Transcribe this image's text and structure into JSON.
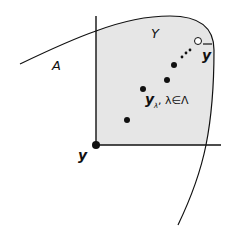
{
  "diagram": {
    "labels": {
      "set_A": "A",
      "set_Y": "Y",
      "point_bar_y": "y",
      "sequence_main": "y",
      "sequence_sub": "λ",
      "sequence_index": ", λ∈Λ",
      "origin_y": "y"
    },
    "colors": {
      "region_fill": "#e6e6e6",
      "stroke": "#111111",
      "background": "#ffffff"
    },
    "points": [
      {
        "name": "origin",
        "x": 96,
        "y": 145,
        "r": 4,
        "filled": true
      },
      {
        "name": "seq-1",
        "x": 127,
        "y": 120,
        "r": 3,
        "filled": true
      },
      {
        "name": "seq-2",
        "x": 143,
        "y": 89,
        "r": 3,
        "filled": true
      },
      {
        "name": "seq-3",
        "x": 167,
        "y": 80,
        "r": 3,
        "filled": true
      },
      {
        "name": "seq-4",
        "x": 174,
        "y": 65,
        "r": 3,
        "filled": true
      },
      {
        "name": "limit-open",
        "x": 198,
        "y": 41,
        "r": 3.5,
        "filled": false
      }
    ]
  }
}
